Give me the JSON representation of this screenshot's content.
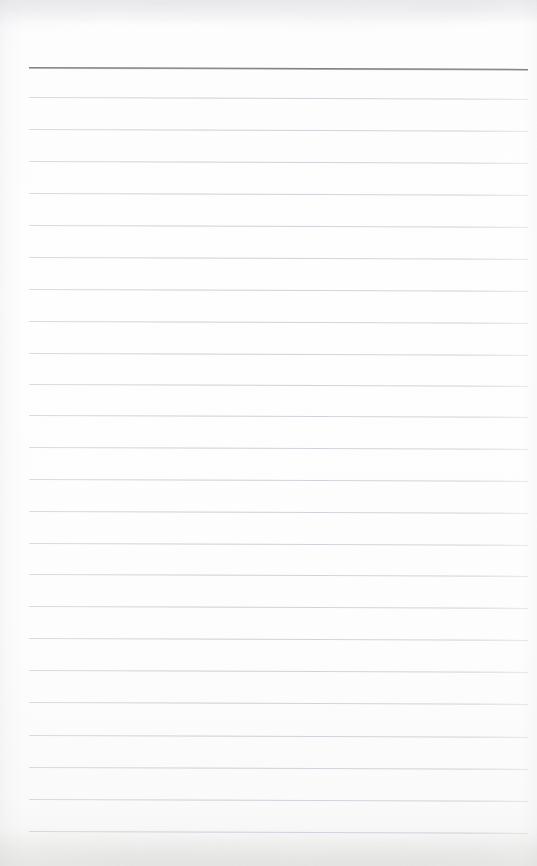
{
  "document": {
    "kind": "scanned-ruled-notepad-page",
    "title": "Blank ruled notepad page",
    "content_text": "",
    "page_width": 537,
    "page_height": 866,
    "paper_color": "#fdfdfd",
    "background_color": "#ffffff"
  },
  "ruling": {
    "style": "wide-ruled",
    "line_count_total": 25,
    "light_line_count": 24,
    "heavy_line_count": 1,
    "line_spacing_px": 32,
    "left_margin_x": 29,
    "right_margin_x": 528,
    "line_length_px": 499,
    "first_line_y": 67,
    "last_line_y": 831,
    "slant_deg": 0.22,
    "heavy_line_color": "#76767f",
    "light_line_color": "#cdcdd5",
    "lines": [
      {
        "index": 0,
        "y": 67,
        "weight": "heavy",
        "color": "#76767f"
      },
      {
        "index": 1,
        "y": 97,
        "weight": "light",
        "color": "#cdcdd5"
      },
      {
        "index": 2,
        "y": 129,
        "weight": "light",
        "color": "#cdcdd5"
      },
      {
        "index": 3,
        "y": 161,
        "weight": "light",
        "color": "#cdcdd5"
      },
      {
        "index": 4,
        "y": 193,
        "weight": "light",
        "color": "#cdcdd5"
      },
      {
        "index": 5,
        "y": 225,
        "weight": "light",
        "color": "#cdcdd5"
      },
      {
        "index": 6,
        "y": 257,
        "weight": "light",
        "color": "#cdcdd5"
      },
      {
        "index": 7,
        "y": 289,
        "weight": "light",
        "color": "#cdcdd5"
      },
      {
        "index": 8,
        "y": 321,
        "weight": "light",
        "color": "#cdcdd5"
      },
      {
        "index": 9,
        "y": 353,
        "weight": "light",
        "color": "#cdcdd5"
      },
      {
        "index": 10,
        "y": 384,
        "weight": "light",
        "color": "#cdcdd5"
      },
      {
        "index": 11,
        "y": 415,
        "weight": "light",
        "color": "#cdcdd5"
      },
      {
        "index": 12,
        "y": 447,
        "weight": "light",
        "color": "#cdcdd5"
      },
      {
        "index": 13,
        "y": 479,
        "weight": "light",
        "color": "#cdcdd5"
      },
      {
        "index": 14,
        "y": 511,
        "weight": "light",
        "color": "#cdcdd5"
      },
      {
        "index": 15,
        "y": 543,
        "weight": "light",
        "color": "#cdcdd5"
      },
      {
        "index": 16,
        "y": 574,
        "weight": "light",
        "color": "#cdcdd5"
      },
      {
        "index": 17,
        "y": 606,
        "weight": "light",
        "color": "#cdcdd5"
      },
      {
        "index": 18,
        "y": 638,
        "weight": "light",
        "color": "#cdcdd5"
      },
      {
        "index": 19,
        "y": 670,
        "weight": "light",
        "color": "#cdcdd5"
      },
      {
        "index": 20,
        "y": 702,
        "weight": "light",
        "color": "#cdcdd5"
      },
      {
        "index": 21,
        "y": 735,
        "weight": "light",
        "color": "#cdcdd5"
      },
      {
        "index": 22,
        "y": 767,
        "weight": "light",
        "color": "#cdcdd5"
      },
      {
        "index": 23,
        "y": 799,
        "weight": "light",
        "color": "#cdcdd5"
      },
      {
        "index": 24,
        "y": 831,
        "weight": "light",
        "color": "#cdcdd5"
      }
    ]
  }
}
